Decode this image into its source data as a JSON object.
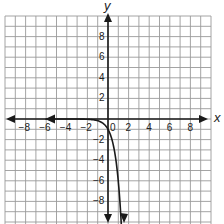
{
  "chart_data": {
    "type": "line",
    "title": "",
    "xlabel": "x",
    "ylabel": "y",
    "xlim": [
      -10,
      10
    ],
    "ylim": [
      -10,
      10
    ],
    "grid": true,
    "legend": null,
    "x_ticks": [
      -8,
      -6,
      -4,
      -2,
      0,
      2,
      4,
      6,
      8
    ],
    "x_tick_labels": [
      "−8",
      "−6",
      "−4",
      "−2",
      "0",
      "2",
      "4",
      "6",
      "8"
    ],
    "y_ticks": [
      8,
      6,
      4,
      2,
      -2,
      -4,
      -6,
      -8
    ],
    "y_tick_labels": [
      "8",
      "6",
      "4",
      "2",
      "−2",
      "−4",
      "−6",
      "−8"
    ],
    "series": [
      {
        "name": "curve",
        "description": "Decreasing exponential-type curve with horizontal asymptote y = 0 approached from below as x -> -infinity; passes through (0, -1); arrows at both ends",
        "equation_estimate": "y = -e^(1.8x)",
        "x": [
          -9.5,
          -6,
          -4,
          -2,
          -1,
          -0.5,
          0,
          0.5,
          1,
          1.2,
          1.3
        ],
        "y": [
          0,
          0,
          0,
          -0.03,
          -0.17,
          -0.41,
          -1,
          -2.46,
          -6.05,
          -8.68,
          -10
        ],
        "color": "#222222"
      }
    ],
    "colors": {
      "grid": "#9a9a9a",
      "axes": "#1a1a1a",
      "curve": "#1a1a1a",
      "text": "#222222"
    }
  }
}
